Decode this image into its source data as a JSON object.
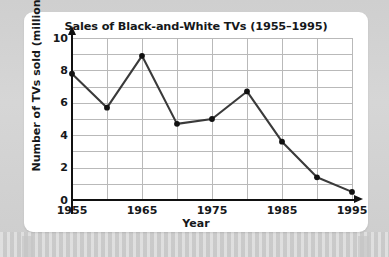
{
  "chart_data": {
    "type": "line",
    "title": "Sales of Black-and-White TVs (1955–1995)",
    "xlabel": "Year",
    "ylabel": "Number of TVs sold (millions)",
    "x": [
      1955,
      1960,
      1965,
      1970,
      1975,
      1980,
      1985,
      1990,
      1995
    ],
    "values": [
      7.8,
      5.7,
      8.9,
      4.7,
      5.0,
      6.7,
      3.6,
      1.4,
      0.5
    ],
    "series": [
      {
        "name": "Number of TVs sold (millions)",
        "values": [
          7.8,
          5.7,
          8.9,
          4.7,
          5.0,
          6.7,
          3.6,
          1.4,
          0.5
        ]
      }
    ],
    "xlim": [
      1955,
      1995
    ],
    "ylim": [
      0,
      10
    ],
    "xtick_labels": [
      "1955",
      "1965",
      "1975",
      "1985",
      "1995"
    ],
    "xtick_values": [
      1955,
      1965,
      1975,
      1985,
      1995
    ],
    "ytick_labels": [
      "0",
      "2",
      "4",
      "6",
      "8",
      "10"
    ],
    "ytick_values": [
      0,
      2,
      4,
      6,
      8,
      10
    ],
    "x_gridline_values": [
      1955,
      1960,
      1965,
      1970,
      1975,
      1980,
      1985,
      1990,
      1995
    ],
    "y_gridline_values": [
      0,
      1,
      2,
      3,
      4,
      5,
      6,
      7,
      8,
      9,
      10
    ],
    "grid": true,
    "legend": "none",
    "marker": "circle",
    "line_color": "#3a3a3a",
    "marker_color": "#111111",
    "grid_color": "#b9b9b9",
    "axis_color": "#111111",
    "text_color": "#16181a",
    "plot_background": "#ffffff",
    "page_background": "#d2d2d2"
  }
}
